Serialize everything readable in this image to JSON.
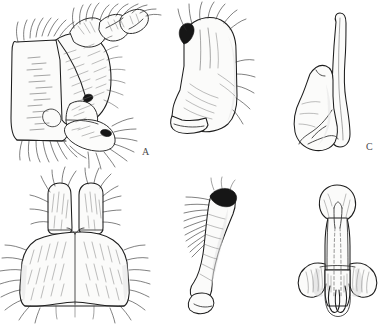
{
  "figure": {
    "type": "scientific-illustration-plate",
    "medium": "pen-and-ink line drawing",
    "background_color": "#ffffff",
    "ink_color": "#1d1d1d",
    "width_px": 382,
    "height_px": 324,
    "panel_count": 6,
    "layout": "2 rows x 3 columns",
    "label_style": "single uppercase letter, lower-right of each panel",
    "label_color": "#4a4a4a"
  },
  "panels": [
    {
      "id": "A",
      "label": "A",
      "label_x": 142,
      "label_y": 147,
      "row": 1,
      "column": 1,
      "subject": "lateral view of male terminalia with setose surstylus and cercus",
      "orientation": "lateral",
      "features": [
        "dense setae",
        "hatched sclerite surface",
        "dark sclerotized spot",
        "jointed appendage"
      ],
      "bounds": {
        "x": 4,
        "y": 6,
        "w": 150,
        "h": 156
      }
    },
    {
      "id": "B",
      "label": "B",
      "label_x": 127,
      "label_y": 303,
      "row": 2,
      "column": 1,
      "subject": "ventral view of bilobed epandrium with paired cerci",
      "orientation": "ventral",
      "features": [
        "bilateral symmetry",
        "two dorsal lobes",
        "marginal setae fringe",
        "median suture"
      ],
      "bounds": {
        "x": 10,
        "y": 182,
        "w": 130,
        "h": 128
      }
    },
    {
      "id": "C",
      "label": "C",
      "label_x": 206,
      "label_y": 143,
      "row": 1,
      "column": 2,
      "subject": "blade-like gonostylus with hooked apex",
      "orientation": "lateral",
      "features": [
        "hooked dark apex",
        "apical setae",
        "smooth broad blade",
        "basal foot"
      ],
      "bounds": {
        "x": 168,
        "y": 12,
        "w": 78,
        "h": 135
      }
    },
    {
      "id": "D",
      "label": "D",
      "label_x": 229,
      "label_y": 303,
      "row": 2,
      "column": 2,
      "subject": "elongate curved gonostylus with darkened apex",
      "orientation": "lateral",
      "features": [
        "dark sclerotized apex",
        "comb of subapical setae",
        "sinuous shaft",
        "expanded base"
      ],
      "bounds": {
        "x": 176,
        "y": 182,
        "w": 70,
        "h": 128
      }
    },
    {
      "id": "E",
      "label": "E",
      "label_x": 350,
      "label_y": 165,
      "row": 1,
      "column": 3,
      "subject": "gonocoxite with long slender apodeme",
      "orientation": "lateral",
      "features": [
        "long curved spine",
        "rounded basal plate",
        "glabrous surface"
      ],
      "bounds": {
        "x": 296,
        "y": 14,
        "w": 72,
        "h": 150
      }
    },
    {
      "id": "F",
      "label": "F",
      "label_x": 363,
      "label_y": 303,
      "row": 2,
      "column": 3,
      "subject": "aedeagus in ventral view with paired parameres",
      "orientation": "ventral",
      "features": [
        "bulbous apex",
        "median internal duct shown dashed",
        "lateral wings",
        "paired basal arms"
      ],
      "bounds": {
        "x": 300,
        "y": 184,
        "w": 74,
        "h": 124
      }
    }
  ]
}
